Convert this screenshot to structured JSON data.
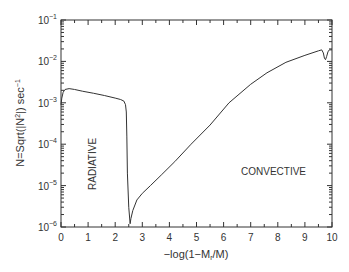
{
  "chart_data": {
    "type": "line",
    "title": "",
    "xlabel": "-log(1-M_r/M)",
    "xlabel_parts": {
      "main": "−log(1−M",
      "sub": "r",
      "tail": "/M)"
    },
    "ylabel": "N=Sqrt(|N²|) sec⁻¹",
    "ylabel_parts": {
      "a": "N=Sqrt(|N",
      "sup": "2",
      "b": "|) sec",
      "sup2": "−1"
    },
    "xlim": [
      0,
      10
    ],
    "ylim": [
      1e-06,
      0.1
    ],
    "yscale": "log",
    "grid": false,
    "x_ticks": [
      "0",
      "1",
      "2",
      "3",
      "4",
      "5",
      "6",
      "7",
      "8",
      "9",
      "10"
    ],
    "y_ticks": [
      {
        "base": "10",
        "exp": "−1"
      },
      {
        "base": "10",
        "exp": "−2"
      },
      {
        "base": "10",
        "exp": "−3"
      },
      {
        "base": "10",
        "exp": "−4"
      },
      {
        "base": "10",
        "exp": "−5"
      },
      {
        "base": "10",
        "exp": "−6"
      }
    ],
    "annotations": [
      {
        "text": "RADIATIVE",
        "x": 0.8,
        "y": 1e-05,
        "rotation": -90
      },
      {
        "text": "CONVECTIVE",
        "x": 6.7,
        "y": 1.2e-05,
        "rotation": 0
      }
    ],
    "series": [
      {
        "name": "Brunt-Vaisala frequency",
        "color": "#333333",
        "x": [
          0.0,
          0.03,
          0.08,
          0.15,
          0.3,
          0.5,
          0.8,
          1.2,
          1.6,
          2.0,
          2.2,
          2.32,
          2.38,
          2.41,
          2.43,
          2.45,
          2.5,
          2.55,
          2.58,
          2.65,
          2.8,
          3.0,
          3.3,
          3.7,
          4.2,
          4.8,
          5.5,
          6.2,
          7.0,
          7.6,
          8.3,
          9.0,
          9.5,
          9.62,
          9.68,
          9.72,
          9.76,
          9.8,
          9.85,
          9.9,
          10.0
        ],
        "y": [
          0.0009,
          0.0013,
          0.0018,
          0.0021,
          0.0022,
          0.0021,
          0.0019,
          0.0017,
          0.0015,
          0.0013,
          0.0012,
          0.0011,
          0.0009,
          0.0006,
          0.00015,
          2e-05,
          3e-06,
          1.2e-06,
          1.6e-06,
          2.5e-06,
          4.5e-06,
          6.5e-06,
          1e-05,
          1.8e-05,
          3.8e-05,
          0.0001,
          0.00029,
          0.001,
          0.0028,
          0.0053,
          0.0095,
          0.014,
          0.018,
          0.019,
          0.016,
          0.012,
          0.011,
          0.013,
          0.017,
          0.019,
          0.019
        ]
      }
    ]
  }
}
